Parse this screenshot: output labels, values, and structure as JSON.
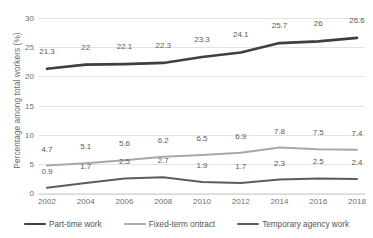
{
  "chart_data": {
    "type": "line",
    "title": "",
    "xlabel": "",
    "ylabel": "Percentage among total workers (%)",
    "categories": [
      "2002",
      "2004",
      "2006",
      "2008",
      "2010",
      "2012",
      "2014",
      "2016",
      "2018"
    ],
    "x": [
      2002,
      2004,
      2006,
      2008,
      2010,
      2012,
      2014,
      2016,
      2018
    ],
    "ylim": [
      0,
      30
    ],
    "yticks": [
      "0",
      "5",
      "10",
      "15",
      "20",
      "25",
      "30"
    ],
    "ytick_values": [
      0,
      5,
      10,
      15,
      20,
      25,
      30
    ],
    "grid": true,
    "legend_position": "bottom",
    "data_labels": true,
    "series": [
      {
        "name": "Part-time work",
        "color": "#3f3f3f",
        "values": [
          21.3,
          22,
          22.1,
          22.3,
          23.3,
          24.1,
          25.7,
          26,
          26.6
        ],
        "labels": [
          "21.3",
          "22",
          "22.1",
          "22.3",
          "23.3",
          "24.1",
          "25.7",
          "26",
          "26.6"
        ]
      },
      {
        "name": "Fixed-term ontract",
        "color": "#a8a8a8",
        "values": [
          4.7,
          5.1,
          5.6,
          6.2,
          6.5,
          6.9,
          7.8,
          7.5,
          7.4
        ],
        "labels": [
          "4.7",
          "5.1",
          "5.6",
          "6.2",
          "6.5",
          "6.9",
          "7.8",
          "7.5",
          "7.4"
        ]
      },
      {
        "name": "Temporary agency work",
        "color": "#5c5c5c",
        "values": [
          0.9,
          1.7,
          2.5,
          2.7,
          1.9,
          1.7,
          2.3,
          2.5,
          2.4
        ],
        "labels": [
          "0.9",
          "1.7",
          "2.5",
          "2.7",
          "1.9",
          "1.7",
          "2.3",
          "2.5",
          "2.4"
        ]
      }
    ]
  },
  "colors": {
    "gridline": "#e3e3e3",
    "axis_text": "#6f6f6f",
    "label_text": "#5b5b5b",
    "background": "#ffffff"
  }
}
